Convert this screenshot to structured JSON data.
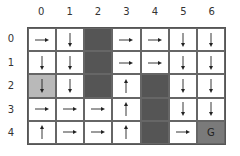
{
  "colors": {
    "wall": "#555555",
    "start": "#b9b9b9",
    "goal": "#7a7a7a",
    "empty": "#ffffff",
    "arrow": "#222222"
  },
  "column_labels": [
    "0",
    "1",
    "2",
    "3",
    "4",
    "5",
    "6"
  ],
  "row_labels": [
    "0",
    "1",
    "2",
    "3",
    "4"
  ],
  "grid": [
    [
      {
        "type": "arrow",
        "dir": "right"
      },
      {
        "type": "arrow",
        "dir": "down"
      },
      {
        "type": "wall"
      },
      {
        "type": "arrow",
        "dir": "right"
      },
      {
        "type": "arrow",
        "dir": "right"
      },
      {
        "type": "arrow",
        "dir": "down"
      },
      {
        "type": "arrow",
        "dir": "down"
      }
    ],
    [
      {
        "type": "arrow",
        "dir": "down"
      },
      {
        "type": "arrow",
        "dir": "down"
      },
      {
        "type": "wall"
      },
      {
        "type": "arrow",
        "dir": "right"
      },
      {
        "type": "arrow",
        "dir": "right"
      },
      {
        "type": "arrow",
        "dir": "down"
      },
      {
        "type": "arrow",
        "dir": "down"
      }
    ],
    [
      {
        "type": "start",
        "dir": "down"
      },
      {
        "type": "arrow",
        "dir": "down"
      },
      {
        "type": "wall"
      },
      {
        "type": "arrow",
        "dir": "up"
      },
      {
        "type": "wall"
      },
      {
        "type": "arrow",
        "dir": "down"
      },
      {
        "type": "arrow",
        "dir": "down"
      }
    ],
    [
      {
        "type": "arrow",
        "dir": "right"
      },
      {
        "type": "arrow",
        "dir": "right"
      },
      {
        "type": "arrow",
        "dir": "right"
      },
      {
        "type": "arrow",
        "dir": "up"
      },
      {
        "type": "wall"
      },
      {
        "type": "arrow",
        "dir": "down"
      },
      {
        "type": "arrow",
        "dir": "down"
      }
    ],
    [
      {
        "type": "arrow",
        "dir": "up"
      },
      {
        "type": "arrow",
        "dir": "right"
      },
      {
        "type": "arrow",
        "dir": "right"
      },
      {
        "type": "arrow",
        "dir": "up"
      },
      {
        "type": "wall"
      },
      {
        "type": "arrow",
        "dir": "right"
      },
      {
        "type": "goal",
        "label": "G"
      }
    ]
  ]
}
